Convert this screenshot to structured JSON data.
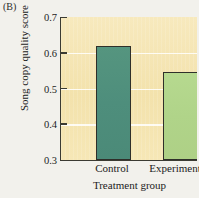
{
  "figure": {
    "panel_label": "(B)",
    "background_color": "#f2f1ec",
    "plot_background_color": "#f6e7b4"
  },
  "chart_data": {
    "type": "bar",
    "title": "",
    "panel": "(B)",
    "categories": [
      "Control",
      "Experimental"
    ],
    "values": [
      0.62,
      0.545
    ],
    "series": [
      {
        "name": "Song copy quality score",
        "values": [
          0.62,
          0.545
        ],
        "colors": [
          "#4e8e7c",
          "#b0d489"
        ]
      }
    ],
    "xlabel": "Treatment group",
    "ylabel": "Song copy quality score",
    "ylim": [
      0.3,
      0.7
    ],
    "yticks": [
      0.3,
      0.4,
      0.5,
      0.6,
      0.7
    ],
    "ytick_labels": [
      "0.3",
      "0.4",
      "0.5",
      "0.6",
      "0.7"
    ],
    "grid": true,
    "grid_color": "#ffffff",
    "legend": false,
    "bar_edge_color": "#2f2f2a"
  }
}
